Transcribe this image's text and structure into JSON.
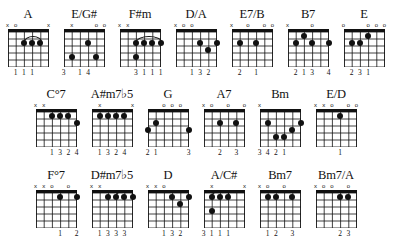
{
  "document": {
    "title": "Guitar Chord Diagram Chart",
    "strings": 6,
    "frets": 5,
    "ink_color": "#111111",
    "background_color": "#ffffff"
  },
  "legend": {
    "open_string_symbol": "o",
    "muted_string_symbol": "x"
  },
  "rows": [
    {
      "index": 0,
      "chords": [
        {
          "name": "A",
          "markers": [
            "x",
            "o",
            "",
            "",
            "",
            "x"
          ],
          "dots": [
            {
              "string": 2,
              "fret": 2
            },
            {
              "string": 3,
              "fret": 2
            },
            {
              "string": 4,
              "fret": 2
            }
          ],
          "barre": null,
          "arc": {
            "from_string": 2,
            "to_string": 4,
            "fret": 2
          },
          "fingers": [
            "",
            "1",
            "1",
            "1",
            "",
            ""
          ]
        },
        {
          "name": "E/G#",
          "markers": [
            "",
            "x",
            "",
            "",
            "o",
            "o"
          ],
          "dots": [
            {
              "string": 1,
              "fret": 4
            },
            {
              "string": 3,
              "fret": 2
            },
            {
              "string": 4,
              "fret": 4
            }
          ],
          "barre": null,
          "arc": null,
          "fingers": [
            "3",
            "",
            "1",
            "4",
            "",
            ""
          ]
        },
        {
          "name": "F#m",
          "markers": [
            "x",
            "x",
            "",
            "",
            "",
            ""
          ],
          "dots": [
            {
              "string": 2,
              "fret": 2
            },
            {
              "string": 3,
              "fret": 2
            },
            {
              "string": 4,
              "fret": 2
            },
            {
              "string": 5,
              "fret": 2
            },
            {
              "string": 2,
              "fret": 4
            }
          ],
          "barre": null,
          "arc": {
            "from_string": 2,
            "to_string": 5,
            "fret": 2
          },
          "fingers": [
            "",
            "",
            "3",
            "1",
            "1",
            "1"
          ]
        },
        {
          "name": "D/A",
          "markers": [
            "x",
            "o",
            "o",
            "",
            "",
            ""
          ],
          "dots": [
            {
              "string": 3,
              "fret": 2
            },
            {
              "string": 4,
              "fret": 3
            },
            {
              "string": 5,
              "fret": 2
            }
          ],
          "barre": null,
          "arc": null,
          "fingers": [
            "",
            "",
            "1",
            "3",
            "2",
            ""
          ]
        },
        {
          "name": "E7/B",
          "markers": [
            "x",
            "",
            "o",
            "",
            "o",
            "o"
          ],
          "dots": [
            {
              "string": 1,
              "fret": 2
            },
            {
              "string": 3,
              "fret": 2
            }
          ],
          "barre": null,
          "arc": null,
          "fingers": [
            "",
            "2",
            "",
            "1",
            "",
            ""
          ]
        },
        {
          "name": "B7",
          "markers": [
            "x",
            "",
            "",
            "o",
            "",
            ""
          ],
          "dots": [
            {
              "string": 1,
              "fret": 2
            },
            {
              "string": 2,
              "fret": 1
            },
            {
              "string": 3,
              "fret": 2
            },
            {
              "string": 5,
              "fret": 2
            }
          ],
          "barre": null,
          "arc": null,
          "fingers": [
            "",
            "2",
            "1",
            "3",
            "",
            "4"
          ]
        },
        {
          "name": "E",
          "markers": [
            "o",
            "",
            "",
            "o",
            "o",
            "o"
          ],
          "dots": [
            {
              "string": 1,
              "fret": 2
            },
            {
              "string": 2,
              "fret": 2
            },
            {
              "string": 3,
              "fret": 1
            }
          ],
          "barre": null,
          "arc": null,
          "fingers": [
            "",
            "2",
            "3",
            "1",
            "",
            ""
          ]
        }
      ]
    },
    {
      "index": 1,
      "chords": [
        {
          "name": "C°7",
          "markers": [
            "x",
            "x",
            "",
            "",
            "",
            ""
          ],
          "dots": [
            {
              "string": 2,
              "fret": 1
            },
            {
              "string": 3,
              "fret": 1
            },
            {
              "string": 4,
              "fret": 1
            },
            {
              "string": 5,
              "fret": 2
            }
          ],
          "barre": null,
          "arc": null,
          "fingers": [
            "",
            "",
            "1",
            "3",
            "2",
            "4"
          ]
        },
        {
          "name": "A#m7♭5",
          "markers": [
            "",
            "x",
            "",
            "",
            "",
            "x"
          ],
          "dots": [
            {
              "string": 1,
              "fret": 1
            },
            {
              "string": 2,
              "fret": 1
            },
            {
              "string": 3,
              "fret": 1
            },
            {
              "string": 4,
              "fret": 1
            }
          ],
          "barre": null,
          "arc": null,
          "fingers": [
            "",
            "1",
            "3",
            "2",
            "4",
            ""
          ]
        },
        {
          "name": "G",
          "markers": [
            "",
            "",
            "o",
            "o",
            "o",
            ""
          ],
          "dots": [
            {
              "string": 0,
              "fret": 3
            },
            {
              "string": 1,
              "fret": 2
            },
            {
              "string": 5,
              "fret": 3
            }
          ],
          "barre": null,
          "arc": null,
          "fingers": [
            "2",
            "1",
            "",
            "",
            "",
            "3"
          ]
        },
        {
          "name": "A7",
          "markers": [
            "x",
            "o",
            "",
            "o",
            "",
            "o"
          ],
          "dots": [
            {
              "string": 2,
              "fret": 2
            },
            {
              "string": 4,
              "fret": 2
            }
          ],
          "barre": null,
          "arc": null,
          "fingers": [
            "",
            "",
            "2",
            "",
            "3",
            ""
          ]
        },
        {
          "name": "Bm",
          "markers": [
            "x",
            "",
            "",
            "",
            "",
            ""
          ],
          "dots": [
            {
              "string": 1,
              "fret": 2
            },
            {
              "string": 2,
              "fret": 4
            },
            {
              "string": 3,
              "fret": 4
            },
            {
              "string": 4,
              "fret": 3
            },
            {
              "string": 5,
              "fret": 2
            }
          ],
          "barre": null,
          "arc": null,
          "fingers": [
            "3",
            "4",
            "2",
            "1",
            "",
            ""
          ]
        },
        {
          "name": "E/D",
          "markers": [
            "x",
            "x",
            "o",
            "",
            "o",
            "o"
          ],
          "dots": [
            {
              "string": 3,
              "fret": 1
            }
          ],
          "barre": null,
          "arc": null,
          "fingers": [
            "",
            "",
            "",
            "1",
            "",
            ""
          ]
        }
      ]
    },
    {
      "index": 2,
      "chords": [
        {
          "name": "F°7",
          "markers": [
            "x",
            "x",
            "o",
            "",
            "o",
            ""
          ],
          "dots": [
            {
              "string": 3,
              "fret": 1
            },
            {
              "string": 5,
              "fret": 1
            }
          ],
          "barre": null,
          "arc": null,
          "fingers": [
            "",
            "",
            "",
            "1",
            "",
            "2"
          ]
        },
        {
          "name": "D#m7♭5",
          "markers": [
            "x",
            "x",
            "",
            "",
            "",
            ""
          ],
          "dots": [
            {
              "string": 2,
              "fret": 1
            },
            {
              "string": 3,
              "fret": 1
            },
            {
              "string": 4,
              "fret": 1
            },
            {
              "string": 5,
              "fret": 1
            }
          ],
          "barre": null,
          "arc": {
            "from_string": 3,
            "to_string": 5,
            "fret": 1
          },
          "fingers": [
            "",
            "1",
            "3",
            "3",
            "3",
            ""
          ]
        },
        {
          "name": "D",
          "markers": [
            "x",
            "x",
            "o",
            "",
            "",
            ""
          ],
          "dots": [
            {
              "string": 3,
              "fret": 1
            },
            {
              "string": 4,
              "fret": 2
            },
            {
              "string": 5,
              "fret": 1
            }
          ],
          "barre": null,
          "arc": null,
          "fingers": [
            "",
            "",
            "1",
            "3",
            "2",
            ""
          ]
        },
        {
          "name": "A/C#",
          "markers": [
            "",
            "x",
            "",
            "",
            "",
            "x"
          ],
          "dots": [
            {
              "string": 1,
              "fret": 1
            },
            {
              "string": 2,
              "fret": 1
            },
            {
              "string": 3,
              "fret": 1
            },
            {
              "string": 1,
              "fret": 3
            }
          ],
          "barre": null,
          "arc": {
            "from_string": 1,
            "to_string": 3,
            "fret": 1
          },
          "fingers": [
            "3",
            "1",
            "1",
            "1",
            "",
            ""
          ]
        },
        {
          "name": "Bm7",
          "markers": [
            "x",
            "o",
            "",
            "o",
            "",
            ""
          ],
          "dots": [
            {
              "string": 1,
              "fret": 1
            },
            {
              "string": 2,
              "fret": 1
            },
            {
              "string": 4,
              "fret": 1
            }
          ],
          "barre": null,
          "arc": null,
          "fingers": [
            "",
            "1",
            "2",
            "",
            "3",
            ""
          ]
        },
        {
          "name": "Bm7/A",
          "markers": [
            "x",
            "o",
            "o",
            "",
            "o",
            ""
          ],
          "dots": [
            {
              "string": 3,
              "fret": 1
            },
            {
              "string": 4,
              "fret": 1
            }
          ],
          "barre": null,
          "arc": null,
          "fingers": [
            "",
            "",
            "",
            "2",
            "3",
            ""
          ]
        }
      ]
    }
  ]
}
